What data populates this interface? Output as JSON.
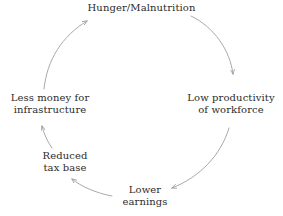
{
  "diagram": {
    "type": "vicious-cycle",
    "direction": "clockwise",
    "stroke_color": "#9a9a9a",
    "text_color": "#2b2b2b",
    "background_color": "#ffffff",
    "nodes": [
      {
        "id": "hunger",
        "lines": [
          "Hunger/Malnutrition"
        ],
        "position": "top"
      },
      {
        "id": "productivity",
        "lines": [
          "Low productivity",
          "of workforce"
        ],
        "position": "right"
      },
      {
        "id": "earnings",
        "lines": [
          "Lower",
          "earnings"
        ],
        "position": "bottom"
      },
      {
        "id": "taxbase",
        "lines": [
          "Reduced",
          "tax base"
        ],
        "position": "bottom-left"
      },
      {
        "id": "infrastructure",
        "lines": [
          "Less money for",
          "infrastructure"
        ],
        "position": "left"
      }
    ],
    "edges": [
      {
        "from": "hunger",
        "to": "productivity"
      },
      {
        "from": "productivity",
        "to": "earnings"
      },
      {
        "from": "earnings",
        "to": "taxbase"
      },
      {
        "from": "taxbase",
        "to": "infrastructure"
      },
      {
        "from": "infrastructure",
        "to": "hunger"
      }
    ]
  }
}
